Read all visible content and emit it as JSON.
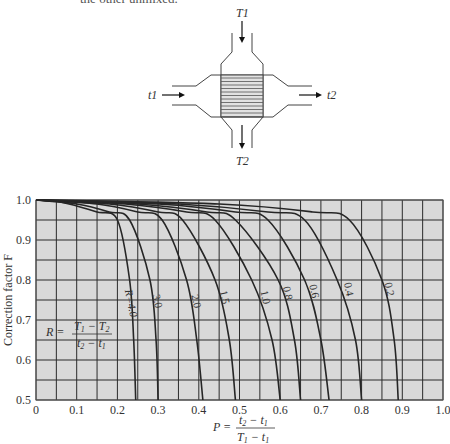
{
  "caption_fragment": "the other unmixed.",
  "diagram": {
    "labels": {
      "hot_in": "T1",
      "hot_out": "T2",
      "cold_in": "t1",
      "cold_out": "t2"
    }
  },
  "chart_data": {
    "type": "line",
    "title": "",
    "xlabel": "P = (t2 - t1) / (T1 - t1)",
    "ylabel": "Correction factor F",
    "xlim": [
      0,
      1.0
    ],
    "ylim": [
      0.5,
      1.0
    ],
    "x_ticks": [
      "0",
      "0.1",
      "0.2",
      "0.3",
      "0.4",
      "0.5",
      "0.6",
      "0.7",
      "0.8",
      "0.9",
      "1.0"
    ],
    "y_ticks": [
      "0.5",
      "0.6",
      "0.7",
      "0.8",
      "0.9",
      "1.0"
    ],
    "grid": true,
    "grid_step_x": 0.05,
    "grid_step_y": 0.05,
    "annotation": "R = (T1 - T2) / (t2 - t1)",
    "series": [
      {
        "name": "R=4.0",
        "label": "R=4.0",
        "points": [
          [
            0,
            1.0
          ],
          [
            0.05,
            0.997
          ],
          [
            0.1,
            0.985
          ],
          [
            0.15,
            0.97
          ],
          [
            0.2,
            0.95
          ],
          [
            0.23,
            0.8
          ],
          [
            0.24,
            0.65
          ],
          [
            0.245,
            0.5
          ]
        ]
      },
      {
        "name": "R=3.0",
        "label": "3.0",
        "points": [
          [
            0,
            1.0
          ],
          [
            0.1,
            0.99
          ],
          [
            0.18,
            0.97
          ],
          [
            0.23,
            0.95
          ],
          [
            0.28,
            0.8
          ],
          [
            0.295,
            0.65
          ],
          [
            0.3,
            0.5
          ]
        ]
      },
      {
        "name": "R=2.0",
        "label": "2.0",
        "points": [
          [
            0,
            1.0
          ],
          [
            0.15,
            0.99
          ],
          [
            0.25,
            0.97
          ],
          [
            0.31,
            0.95
          ],
          [
            0.37,
            0.8
          ],
          [
            0.395,
            0.65
          ],
          [
            0.41,
            0.5
          ]
        ]
      },
      {
        "name": "R=1.5",
        "label": "1.5",
        "points": [
          [
            0,
            1.0
          ],
          [
            0.18,
            0.99
          ],
          [
            0.3,
            0.97
          ],
          [
            0.36,
            0.95
          ],
          [
            0.44,
            0.8
          ],
          [
            0.475,
            0.65
          ],
          [
            0.49,
            0.5
          ]
        ]
      },
      {
        "name": "R=1.0",
        "label": "1.0",
        "points": [
          [
            0,
            1.0
          ],
          [
            0.22,
            0.99
          ],
          [
            0.37,
            0.97
          ],
          [
            0.44,
            0.95
          ],
          [
            0.53,
            0.8
          ],
          [
            0.58,
            0.65
          ],
          [
            0.6,
            0.5
          ]
        ]
      },
      {
        "name": "R=0.8",
        "label": "0.8",
        "points": [
          [
            0,
            1.0
          ],
          [
            0.25,
            0.99
          ],
          [
            0.42,
            0.97
          ],
          [
            0.49,
            0.95
          ],
          [
            0.595,
            0.8
          ],
          [
            0.635,
            0.65
          ],
          [
            0.65,
            0.5
          ]
        ]
      },
      {
        "name": "R=0.6",
        "label": "0.6",
        "points": [
          [
            0,
            1.0
          ],
          [
            0.3,
            0.99
          ],
          [
            0.49,
            0.97
          ],
          [
            0.57,
            0.95
          ],
          [
            0.66,
            0.8
          ],
          [
            0.7,
            0.65
          ],
          [
            0.72,
            0.5
          ]
        ]
      },
      {
        "name": "R=0.4",
        "label": "0.4",
        "points": [
          [
            0,
            1.0
          ],
          [
            0.35,
            0.99
          ],
          [
            0.57,
            0.97
          ],
          [
            0.66,
            0.95
          ],
          [
            0.74,
            0.8
          ],
          [
            0.785,
            0.65
          ],
          [
            0.8,
            0.5
          ]
        ]
      },
      {
        "name": "R=0.2",
        "label": "0.2",
        "points": [
          [
            0,
            1.0
          ],
          [
            0.45,
            0.99
          ],
          [
            0.68,
            0.97
          ],
          [
            0.77,
            0.95
          ],
          [
            0.85,
            0.8
          ],
          [
            0.88,
            0.65
          ],
          [
            0.89,
            0.5
          ]
        ]
      }
    ],
    "curve_label_positions": {
      "R=4.0": [
        0.225,
        0.74
      ],
      "3.0": [
        0.29,
        0.745
      ],
      "2.0": [
        0.385,
        0.745
      ],
      "1.5": [
        0.455,
        0.755
      ],
      "1.0": [
        0.555,
        0.755
      ],
      "0.8": [
        0.61,
        0.765
      ],
      "0.6": [
        0.675,
        0.77
      ],
      "0.4": [
        0.76,
        0.775
      ],
      "0.2": [
        0.86,
        0.775
      ]
    }
  },
  "colors": {
    "plot_bg": "#d9d9d9",
    "grid": "#2b2b2b",
    "curve": "#262626",
    "text": "#333333"
  }
}
